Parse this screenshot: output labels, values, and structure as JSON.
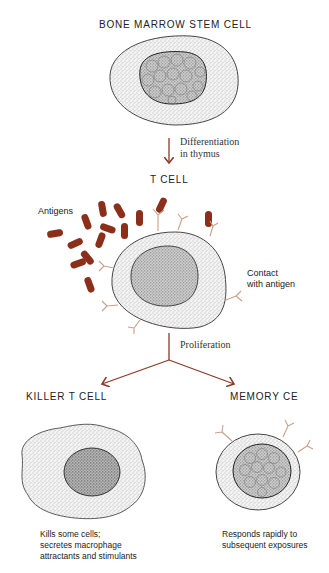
{
  "diagram": {
    "nodes": {
      "stem_cell": {
        "title": "BONE MARROW STEM CELL"
      },
      "t_cell": {
        "title": "T CELL"
      },
      "killer_t_cell": {
        "title": "KILLER T CELL",
        "description_lines": [
          "Kills some cells;",
          "secretes macrophage",
          "attractants and stimulants"
        ]
      },
      "memory_cell": {
        "title": "MEMORY CE",
        "description_lines": [
          "Responds rapidly to",
          "subsequent exposures"
        ]
      }
    },
    "edges": {
      "differentiation": {
        "lines": [
          "Differentiation",
          "in thymus"
        ]
      },
      "proliferation": {
        "label": "Proliferation"
      }
    },
    "annotations": {
      "antigens": "Antigens",
      "contact": [
        "Contact",
        "with antigen"
      ]
    },
    "colors": {
      "arrow": "#8b3a2a",
      "antigen": "#8b2e1a",
      "receptor": "#c9a08a",
      "outline": "#333333",
      "stipple": "#9a9a9a"
    }
  }
}
